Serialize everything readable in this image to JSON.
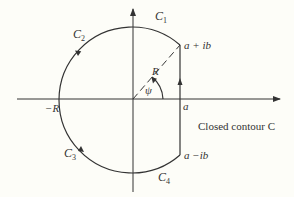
{
  "diagram": {
    "type": "contour-integral",
    "labels": {
      "c1": "C",
      "c1_sub": "1",
      "c2": "C",
      "c2_sub": "2",
      "c3": "C",
      "c3_sub": "3",
      "c4": "C",
      "c4_sub": "4",
      "upper_point": "a + ib",
      "lower_point": "a −ib",
      "neg_r": "−R",
      "radius": "R",
      "angle": "ψ",
      "a": "a",
      "caption": "Closed contour C"
    },
    "colors": {
      "stroke": "#333333",
      "background": "#fdfdf8"
    }
  }
}
